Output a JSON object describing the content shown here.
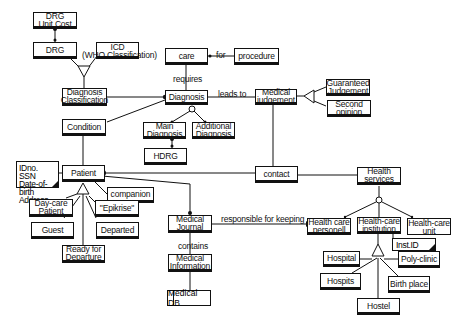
{
  "diagram": {
    "type": "class-diagram",
    "classes": {
      "drg_unit_cost": "DRG\nUnit Cost",
      "drg": "DRG",
      "icd": "ICD",
      "icd_sub": "(WHO Classification)",
      "diagnosis_classification": "Diagnosis\nClassification",
      "care": "care",
      "procedure": "procedure",
      "diagnosis": "Diagnosis",
      "medical_judgement": "Medical\njudgement",
      "guaranteed_judgement": "Guaranteed\nJudgement",
      "second_opinion": "Second\nopinion",
      "main_diagnosis": "Main\nDiagnosis",
      "additional_diagnosis": "Additional\nDiagnosis",
      "hdrg": "HDRG",
      "condition": "Condition",
      "patient": "Patient",
      "patient_attributes": "IDno.\nSSN\nDate-of-birth\nAddress",
      "companion": "companion",
      "day_care_patient": "Day-care\nPatient",
      "epikrise": "\"Epikrise\"",
      "guest": "Guest",
      "departed": "Departed",
      "ready_for_departure": "Ready for\nDeparture",
      "contact": "contact",
      "health_services": "Health\nservices",
      "medical_journal": "Medical\nJournal",
      "health_care_personell": "Health care\npersonell",
      "health_care_institution": "Health-care\ninstitution",
      "health_care_unit": "Health-care\nunit",
      "inst_id": "Inst.ID",
      "medical_information": "Medical\nInformation",
      "medical_db": "Medical DB",
      "hospital": "Hospital",
      "poly_clinic": "Poly-clinic",
      "hospits": "Hospits",
      "birth_place": "Birth place",
      "hostel": "Hostel"
    },
    "associations": {
      "for": "for",
      "requires": "requires",
      "leads_to": "leads to",
      "responsible_for_keeping": "responsible for keeping",
      "contains": "contains"
    }
  }
}
